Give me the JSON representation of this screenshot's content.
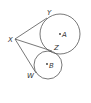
{
  "diagram": {
    "type": "geometry",
    "points": {
      "X": {
        "label": "X",
        "x": 15,
        "y": 39
      },
      "Y": {
        "label": "Y",
        "x": 47,
        "y": 18
      },
      "Z": {
        "label": "Z",
        "x": 52,
        "y": 51
      },
      "W": {
        "label": "W",
        "x": 36,
        "y": 73
      },
      "A": {
        "label": "A",
        "x": 60,
        "y": 34
      },
      "B": {
        "label": "B",
        "x": 47,
        "y": 64
      }
    },
    "circles": [
      {
        "name": "circle-A",
        "center": "A",
        "cx": 60,
        "cy": 34,
        "r": 20
      },
      {
        "name": "circle-B",
        "center": "B",
        "cx": 48,
        "cy": 65,
        "r": 14
      }
    ],
    "segments": [
      {
        "name": "segment-XY",
        "from": "X",
        "to": "Y"
      },
      {
        "name": "segment-XZ",
        "from": "X",
        "to": "Z"
      },
      {
        "name": "segment-XW",
        "from": "X",
        "to": "W"
      }
    ],
    "labels": {
      "X": "X",
      "Y": "Y",
      "Z": "Z",
      "W": "W",
      "A": "A",
      "B": "B"
    },
    "colors": {
      "stroke": "#555555",
      "text": "#333333",
      "background": "#ffffff"
    }
  }
}
